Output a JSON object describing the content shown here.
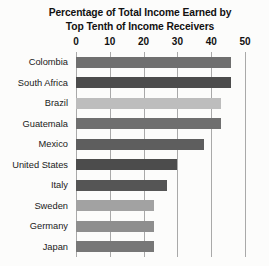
{
  "chart_data": {
    "type": "bar",
    "orientation": "horizontal",
    "title": "Percentage of Total Income Earned by Top Tenth of Income Receivers",
    "title_lines": [
      "Percentage of Total Income Earned by",
      "Top Tenth of Income Receivers"
    ],
    "categories": [
      "Colombia",
      "South Africa",
      "Brazil",
      "Guatemala",
      "Mexico",
      "United States",
      "Italy",
      "Sweden",
      "Germany",
      "Japan"
    ],
    "values": [
      46,
      46,
      43,
      43,
      38,
      30,
      27,
      23,
      23,
      23
    ],
    "bar_colors": [
      "#6f6f6f",
      "#4c4c4c",
      "#bdbdbd",
      "#6f6f6f",
      "#5e5e5e",
      "#4c4c4c",
      "#555555",
      "#a2a2a2",
      "#8e8e8e",
      "#777777"
    ],
    "xlabel": "",
    "ylabel": "",
    "xlim": [
      0,
      50
    ],
    "xticks": [
      0,
      10,
      20,
      30,
      40,
      50
    ],
    "xtick_labels": [
      "0",
      "10",
      "20",
      "30",
      "40",
      "50"
    ],
    "grid": "vertical",
    "legend": "none",
    "axis_color": "#a9a9a9",
    "background": "#fcfcfb"
  }
}
